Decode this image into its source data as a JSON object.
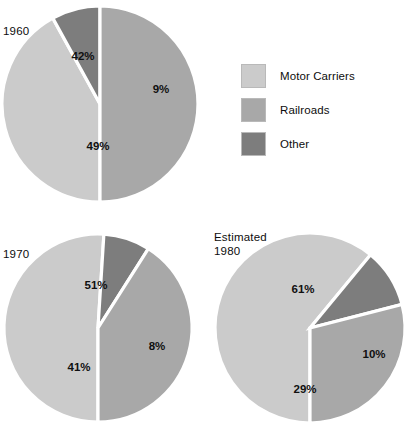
{
  "legend": {
    "items": [
      {
        "label": "Motor Carriers",
        "color": "#cbcbcb",
        "key": "motor_carriers"
      },
      {
        "label": "Railroads",
        "color": "#a8a8a8",
        "key": "railroads"
      },
      {
        "label": "Other",
        "color": "#7d7d7d",
        "key": "other"
      }
    ]
  },
  "charts": [
    {
      "id": "pie-1960",
      "title": "1960",
      "title_line2": "",
      "center": {
        "x": 100,
        "y": 104
      },
      "radius": 98,
      "slices": [
        {
          "name": "Motor Carriers",
          "value": 42,
          "label": "42%",
          "color": "#cbcbcb",
          "start_deg": 180,
          "end_deg": 331.2,
          "label_pos": {
            "x": 83,
            "y": 57
          }
        },
        {
          "name": "Other",
          "value": 9,
          "label": "9%",
          "color": "#7d7d7d",
          "start_deg": 331.2,
          "end_deg": 0,
          "label_pos": {
            "x": 161,
            "y": 90
          }
        },
        {
          "name": "Railroads",
          "value": 49,
          "label": "49%",
          "color": "#a8a8a8",
          "start_deg": 0,
          "end_deg": 180,
          "label_pos": {
            "x": 98,
            "y": 147
          }
        }
      ]
    },
    {
      "id": "pie-1970",
      "title": "1970",
      "title_line2": "",
      "center": {
        "x": 98,
        "y": 328
      },
      "radius": 94,
      "slices": [
        {
          "name": "Motor Carriers",
          "value": 51,
          "label": "51%",
          "color": "#cbcbcb",
          "start_deg": 180,
          "end_deg": 363.6,
          "label_pos": {
            "x": 96,
            "y": 286
          }
        },
        {
          "name": "Other",
          "value": 8,
          "label": "8%",
          "color": "#7d7d7d",
          "start_deg": 3.6,
          "end_deg": 32.4,
          "label_pos": {
            "x": 157,
            "y": 347
          }
        },
        {
          "name": "Railroads",
          "value": 41,
          "label": "41%",
          "color": "#a8a8a8",
          "start_deg": 32.4,
          "end_deg": 180,
          "label_pos": {
            "x": 79,
            "y": 368
          }
        }
      ]
    },
    {
      "id": "pie-1980",
      "title": "Estimated",
      "title_line2": "1980",
      "center": {
        "x": 310,
        "y": 328
      },
      "radius": 95,
      "slices": [
        {
          "name": "Motor Carriers",
          "value": 61,
          "label": "61%",
          "color": "#cbcbcb",
          "start_deg": 180,
          "end_deg": 399.6,
          "label_pos": {
            "x": 303,
            "y": 290
          }
        },
        {
          "name": "Other",
          "value": 10,
          "label": "10%",
          "color": "#7d7d7d",
          "start_deg": 39.6,
          "end_deg": 75.6,
          "label_pos": {
            "x": 374,
            "y": 355
          }
        },
        {
          "name": "Railroads",
          "value": 29,
          "label": "29%",
          "color": "#a8a8a8",
          "start_deg": 75.6,
          "end_deg": 180,
          "label_pos": {
            "x": 305,
            "y": 390
          }
        }
      ]
    }
  ],
  "chart_data": {
    "type": "pie",
    "title": "",
    "subtitle": "",
    "xlabel": "",
    "ylabel": "",
    "grid": false,
    "legend_position": "right",
    "units": "percent",
    "categories": [
      "Motor Carriers",
      "Railroads",
      "Other"
    ],
    "colors": [
      "#cbcbcb",
      "#a8a8a8",
      "#7d7d7d"
    ],
    "panels": [
      {
        "name": "1960",
        "values": [
          42,
          49,
          9
        ],
        "labels": [
          "42%",
          "49%",
          "9%"
        ]
      },
      {
        "name": "1970",
        "values": [
          51,
          41,
          8
        ],
        "labels": [
          "51%",
          "41%",
          "8%"
        ]
      },
      {
        "name": "Estimated 1980",
        "values": [
          61,
          29,
          10
        ],
        "labels": [
          "61%",
          "29%",
          "10%"
        ]
      }
    ],
    "annotations": [
      "1960",
      "1970",
      "Estimated",
      "1980"
    ]
  }
}
